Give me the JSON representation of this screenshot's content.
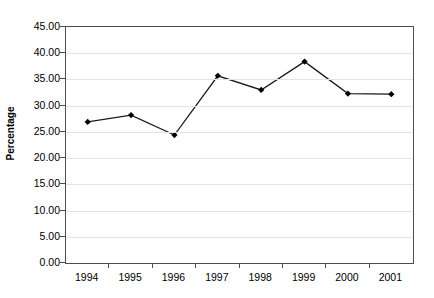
{
  "chart_data": {
    "type": "line",
    "title": "",
    "subtitle": "",
    "xlabel": "",
    "ylabel": "Percentage",
    "categories": [
      "1994",
      "1995",
      "1996",
      "1997",
      "1998",
      "1999",
      "2000",
      "2001"
    ],
    "values": [
      26.9,
      28.2,
      24.4,
      35.7,
      33.0,
      38.4,
      32.3,
      32.2
    ],
    "series": [
      {
        "name": "Percentage",
        "values": [
          26.9,
          28.2,
          24.4,
          35.7,
          33.0,
          38.4,
          32.3,
          32.2
        ]
      }
    ],
    "ylim": [
      0,
      45
    ],
    "ytick_step": 5,
    "ytick_labels": [
      "45.00",
      "40.00",
      "35.00",
      "30.00",
      "25.00",
      "20.00",
      "15.00",
      "10.00",
      "5.00",
      "0.00"
    ],
    "ytick_values": [
      45,
      40,
      35,
      30,
      25,
      20,
      15,
      10,
      5,
      0
    ],
    "grid": true,
    "grid_axis": "y",
    "legend": false,
    "legend_position": "none",
    "marker": "diamond",
    "annotations": []
  },
  "style": {
    "line_color": "#1a1a1a",
    "marker_color": "#000000",
    "grid_color": "#e3e3e3",
    "axis_color": "#4d4d4d",
    "text_color": "#000000",
    "background": "#ffffff"
  }
}
